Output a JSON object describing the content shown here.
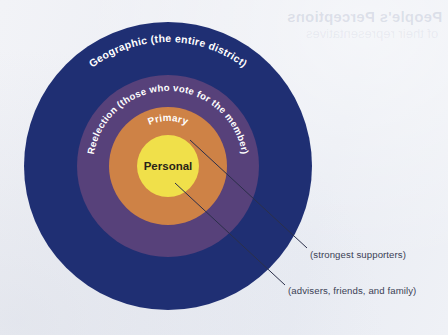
{
  "page": {
    "background_color": "#eef0f5",
    "bleed_through_text": "People's Perceptions",
    "bleed_through_subtext": "of their representatives"
  },
  "diagram": {
    "type": "concentric-circles",
    "center": {
      "x": 168,
      "y": 166
    },
    "rings": [
      {
        "id": "geographic",
        "label": "Geographic (the entire district)",
        "color": "#1f2f73",
        "radius": 144,
        "text_color": "#ffffff",
        "text_font_size": 10.5
      },
      {
        "id": "reelection",
        "label": "Reelection (those who vote for the member)",
        "color": "#57417a",
        "radius": 91,
        "text_color": "#ffffff",
        "text_font_size": 9.6
      },
      {
        "id": "primary",
        "label": "Primary",
        "color": "#ce8246",
        "radius": 59,
        "text_color": "#ffffff",
        "text_font_size": 9.8
      },
      {
        "id": "personal",
        "label": "Personal",
        "color": "#f0e04a",
        "radius": 31,
        "text_color": "#2a2418",
        "text_font_size": 11.5
      }
    ],
    "callouts": [
      {
        "id": "strongest-supporters",
        "text": "(strongest supporters)",
        "refers_to": "primary",
        "line_from": {
          "x": 190,
          "y": 140
        },
        "line_to": {
          "x": 307,
          "y": 248
        }
      },
      {
        "id": "advisers-friends-family",
        "text": "(advisers, friends, and family)",
        "refers_to": "personal",
        "line_from": {
          "x": 175,
          "y": 183
        },
        "line_to": {
          "x": 285,
          "y": 285
        }
      }
    ],
    "line_color": "#2b2f4a"
  }
}
